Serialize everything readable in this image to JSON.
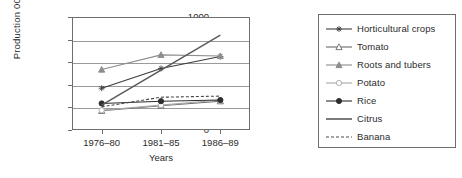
{
  "chart_data": {
    "type": "line",
    "title": "",
    "xlabel": "Years",
    "ylabel": "Production 000't",
    "categories": [
      "1976–80",
      "1981–85",
      "1986–89"
    ],
    "ylim": [
      0,
      1000
    ],
    "yticks": [
      0,
      200,
      400,
      600,
      800,
      1000
    ],
    "grid": true,
    "legend_position": "right",
    "series": [
      {
        "name": "Horticultural crops",
        "values": [
          370,
          545,
          650
        ],
        "marker": "star",
        "line": "solid",
        "color": "#3c3c3c"
      },
      {
        "name": "Tomato",
        "values": [
          170,
          215,
          255
        ],
        "marker": "open-triangle",
        "line": "solid",
        "color": "#6b6b6b"
      },
      {
        "name": "Roots and tubers",
        "values": [
          535,
          665,
          655
        ],
        "marker": "filled-triangle",
        "line": "solid",
        "color": "#8d8d8d"
      },
      {
        "name": "Potato",
        "values": [
          175,
          220,
          265
        ],
        "marker": "open-circle",
        "line": "solid",
        "color": "#a8a8a8"
      },
      {
        "name": "Rice",
        "values": [
          235,
          255,
          265
        ],
        "marker": "filled-circle",
        "line": "solid",
        "color": "#2e2e2e"
      },
      {
        "name": "Citrus",
        "values": [
          220,
          530,
          840
        ],
        "marker": "none",
        "line": "solid",
        "color": "#5a5a5a"
      },
      {
        "name": "Banana",
        "values": [
          205,
          290,
          300
        ],
        "marker": "none",
        "line": "dashed",
        "color": "#4a4a4a"
      }
    ]
  },
  "axis": {
    "y_tick_labels": [
      "1000",
      "800",
      "600",
      "400",
      "200",
      "0"
    ],
    "y_title": "Production 000't",
    "x_tick_labels": [
      "1976–80",
      "1981–85",
      "1986–89"
    ],
    "x_title": "Years"
  }
}
